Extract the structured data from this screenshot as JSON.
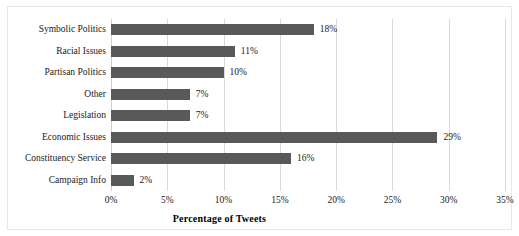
{
  "chart_data": {
    "type": "bar",
    "orientation": "horizontal",
    "title": "",
    "xlabel": "Percentage of Tweets",
    "ylabel": "",
    "categories": [
      "Symbolic Politics",
      "Racial Issues",
      "Partisan Politics",
      "Other",
      "Legislation",
      "Economic Issues",
      "Constituency Service",
      "Campaign Info"
    ],
    "values": [
      18,
      11,
      10,
      7,
      7,
      29,
      16,
      2
    ],
    "data_labels": [
      "18%",
      "11%",
      "10%",
      "7%",
      "7%",
      "29%",
      "16%",
      "2%"
    ],
    "xlim": [
      0,
      35
    ],
    "xticks": [
      0,
      5,
      10,
      15,
      20,
      25,
      30,
      35
    ],
    "xtick_labels": [
      "0%",
      "5%",
      "10%",
      "15%",
      "20%",
      "25%",
      "30%",
      "35%"
    ],
    "grid": "vertical",
    "legend": "none",
    "bar_color": "#595959",
    "gridline_color": "#d9d9d9",
    "text_color": "#1a1a1a"
  }
}
